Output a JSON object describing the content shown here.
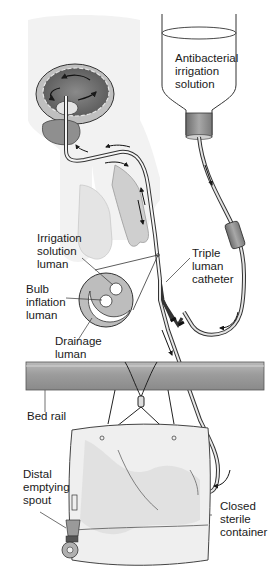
{
  "diagram": {
    "labels": {
      "irrigation_bottle": "Antibacterial\nirrigation\nsolution",
      "irrigation_lumen": "Irrigation\nsolution\nluman",
      "bulb_lumen": "Bulb\ninflation\nluman",
      "drainage_lumen": "Drainage\nluman",
      "catheter": "Triple\nluman\ncatheter",
      "bed_rail": "Bed rail",
      "spout": "Distal\nemptying\nspout",
      "container": "Closed\nsterile\ncontainer"
    },
    "components": [
      {
        "id": "irrigation-bottle",
        "name": "Antibacterial irrigation solution bottle"
      },
      {
        "id": "bladder",
        "name": "Bladder with circulating flow arrows"
      },
      {
        "id": "penis-anatomy",
        "name": "Male anatomy with catheter"
      },
      {
        "id": "catheter-cross-section",
        "name": "Triple lumen catheter cross-section"
      },
      {
        "id": "drip-chamber",
        "name": "In-line drip chamber"
      },
      {
        "id": "bed-rail",
        "name": "Bed rail"
      },
      {
        "id": "drainage-bag",
        "name": "Closed sterile drainage container"
      },
      {
        "id": "emptying-spout",
        "name": "Distal emptying spout"
      }
    ],
    "colors": {
      "line": "#2a2a2a",
      "body_fill": "#ececec",
      "bladder_dark": "#6e6e6e",
      "bladder_mid": "#bdbdbd",
      "rail_fill": "#9a9a9a",
      "rail_light": "#c4c4c4",
      "bag_fill": "#eeeeee",
      "bag_mottle": "#dcdcdc",
      "tube_fill": "#d8d8d8"
    }
  }
}
